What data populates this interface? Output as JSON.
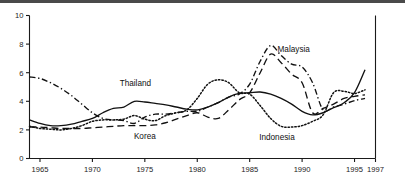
{
  "figure": {
    "title": "",
    "top_rule_color": "#4a4a4a",
    "background": "#ffffff",
    "line_color": "#111111"
  },
  "labels": {
    "thailand": "Thailand",
    "korea": "Korea",
    "malaysia": "Malaysia",
    "indonesia": "Indonesia"
  },
  "axis": {
    "y_ticks": [
      "0",
      "2",
      "4",
      "6",
      "8",
      "10"
    ],
    "x_ticks": [
      "1965",
      "1970",
      "1975",
      "1980",
      "1985",
      "1990",
      "1995",
      "1997"
    ]
  },
  "chart_data": {
    "type": "line",
    "title": "",
    "xlabel": "",
    "ylabel": "",
    "xlim": [
      1964,
      1997
    ],
    "ylim": [
      0,
      10
    ],
    "grid": false,
    "legend": "inline-annotations",
    "x_ticks": [
      1965,
      1970,
      1975,
      1980,
      1985,
      1990,
      1995,
      1997
    ],
    "y_ticks": [
      0,
      2,
      4,
      6,
      8,
      10
    ],
    "x": [
      1964,
      1965,
      1966,
      1967,
      1968,
      1969,
      1970,
      1971,
      1972,
      1973,
      1974,
      1975,
      1976,
      1977,
      1978,
      1979,
      1980,
      1981,
      1982,
      1983,
      1984,
      1985,
      1986,
      1987,
      1988,
      1989,
      1990,
      1991,
      1992,
      1993,
      1994,
      1995,
      1996
    ],
    "series": [
      {
        "name": "Thailand",
        "style": "solid",
        "values": [
          2.7,
          2.45,
          2.3,
          2.3,
          2.4,
          2.6,
          2.8,
          3.2,
          3.5,
          3.6,
          4.0,
          3.95,
          3.85,
          3.75,
          3.6,
          3.45,
          3.4,
          3.6,
          3.9,
          4.3,
          4.55,
          4.6,
          4.65,
          4.5,
          4.2,
          3.8,
          3.3,
          3.05,
          3.2,
          3.55,
          3.9,
          4.6,
          6.2
        ]
      },
      {
        "name": "Korea",
        "style": "dashed",
        "values": [
          2.2,
          2.2,
          2.15,
          2.1,
          2.1,
          2.1,
          2.15,
          2.2,
          2.25,
          2.3,
          2.3,
          2.3,
          2.35,
          2.5,
          2.75,
          3.0,
          3.2,
          2.9,
          2.8,
          3.4,
          4.1,
          4.6,
          6.0,
          7.3,
          6.7,
          5.9,
          5.3,
          3.2,
          3.5,
          3.8,
          4.2,
          4.35,
          4.45
        ]
      },
      {
        "name": "Malaysia",
        "style": "dashdot",
        "values": [
          5.7,
          5.6,
          5.3,
          4.9,
          4.4,
          3.8,
          3.2,
          2.8,
          2.7,
          2.65,
          2.45,
          2.9,
          3.1,
          3.1,
          3.2,
          3.3,
          3.3,
          3.6,
          3.9,
          4.3,
          4.5,
          5.2,
          6.8,
          7.9,
          7.2,
          6.6,
          6.4,
          5.3,
          3.4,
          3.6,
          3.8,
          4.05,
          4.2
        ]
      },
      {
        "name": "Indonesia",
        "style": "dotted",
        "values": [
          2.25,
          2.1,
          2.05,
          2.0,
          2.1,
          2.3,
          2.6,
          2.7,
          2.7,
          2.75,
          3.0,
          2.75,
          2.65,
          3.0,
          3.2,
          3.4,
          4.2,
          5.2,
          5.5,
          5.3,
          4.6,
          4.5,
          3.7,
          2.8,
          2.25,
          2.2,
          2.3,
          2.6,
          3.05,
          4.6,
          4.7,
          4.55,
          4.8
        ]
      }
    ]
  }
}
